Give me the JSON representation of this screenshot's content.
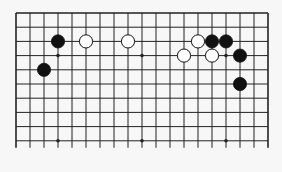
{
  "board": {
    "columns": 19,
    "rows_shown": 10,
    "edges": {
      "top": true,
      "left": true,
      "right": true,
      "bottom": false
    },
    "origin": {
      "x": 16,
      "y": 13
    },
    "spacing_x": 14,
    "spacing_y": 14.2,
    "bottom_line_extend": 7,
    "line_color": "#222222",
    "background": "#f7f7f7",
    "star_points": [
      {
        "col": 3,
        "row": 3
      },
      {
        "col": 9,
        "row": 3
      },
      {
        "col": 15,
        "row": 3
      },
      {
        "col": 3,
        "row": 9
      },
      {
        "col": 9,
        "row": 9
      },
      {
        "col": 15,
        "row": 9
      }
    ],
    "stones": [
      {
        "color": "black",
        "col": 3,
        "row": 2
      },
      {
        "color": "black",
        "col": 2,
        "row": 4
      },
      {
        "color": "white",
        "col": 5,
        "row": 2
      },
      {
        "color": "white",
        "col": 8,
        "row": 2
      },
      {
        "color": "white",
        "col": 13,
        "row": 2
      },
      {
        "color": "black",
        "col": 14,
        "row": 2
      },
      {
        "color": "black",
        "col": 15,
        "row": 2
      },
      {
        "color": "white",
        "col": 12,
        "row": 3
      },
      {
        "color": "white",
        "col": 14,
        "row": 3
      },
      {
        "color": "black",
        "col": 16,
        "row": 3
      },
      {
        "color": "black",
        "col": 16,
        "row": 5
      }
    ]
  }
}
